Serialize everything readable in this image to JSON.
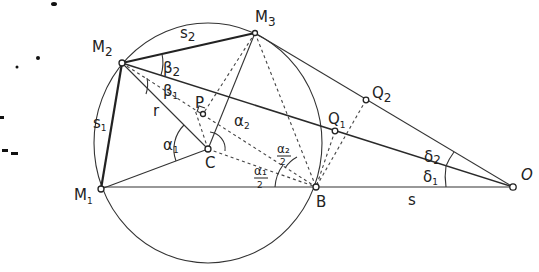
{
  "figure": {
    "type": "geometric diagram"
  },
  "points": [
    {
      "id": "M1",
      "label": "M",
      "sub": "1",
      "x": 101,
      "y": 189
    },
    {
      "id": "M2",
      "label": "M",
      "sub": "2",
      "x": 122,
      "y": 63
    },
    {
      "id": "M3",
      "label": "M",
      "sub": "3",
      "x": 255,
      "y": 33
    },
    {
      "id": "C",
      "label": "C",
      "sub": "",
      "x": 208,
      "y": 149
    },
    {
      "id": "B",
      "label": "B",
      "sub": "",
      "x": 316,
      "y": 187
    },
    {
      "id": "O",
      "label": "O",
      "sub": "",
      "x": 513,
      "y": 187
    },
    {
      "id": "P",
      "label": "P",
      "sub": "",
      "x": 203,
      "y": 114
    },
    {
      "id": "Q1",
      "label": "Q",
      "sub": "1",
      "x": 335,
      "y": 131
    },
    {
      "id": "Q2",
      "label": "Q",
      "sub": "2",
      "x": 366,
      "y": 100
    }
  ],
  "labels": {
    "s1": {
      "main": "s",
      "sub": "1"
    },
    "s2": {
      "main": "s",
      "sub": "2"
    },
    "r": "r",
    "s": "s",
    "alpha1": {
      "main": "α",
      "sub": "1"
    },
    "alpha2": {
      "main": "α",
      "sub": "2"
    },
    "alpha1_half": {
      "num": "α₁",
      "den": "2"
    },
    "alpha2_half": {
      "num": "α₂",
      "den": "2"
    },
    "beta1": {
      "main": "β",
      "sub": "1"
    },
    "beta2": {
      "main": "β",
      "sub": "2"
    },
    "delta1": {
      "main": "δ",
      "sub": "1"
    },
    "delta2": {
      "main": "δ",
      "sub": "2"
    }
  },
  "colors": {
    "ink": "#222222",
    "background": "#ffffff"
  }
}
